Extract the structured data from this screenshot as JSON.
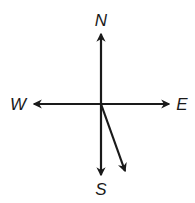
{
  "diagram": {
    "type": "compass-vector",
    "stroke_color": "#1a1a1a",
    "background": "#ffffff",
    "center": {
      "x": 101,
      "y": 104
    },
    "labels": {
      "north": {
        "text": "N",
        "x": 101,
        "y": 20
      },
      "south": {
        "text": "S",
        "x": 101,
        "y": 189
      },
      "east": {
        "text": "E",
        "x": 182,
        "y": 104
      },
      "west": {
        "text": "W",
        "x": 18,
        "y": 104
      }
    },
    "axes": [
      {
        "name": "north",
        "to": {
          "x": 101,
          "y": 34
        }
      },
      {
        "name": "south",
        "to": {
          "x": 101,
          "y": 175
        }
      },
      {
        "name": "east",
        "to": {
          "x": 169,
          "y": 104
        }
      },
      {
        "name": "west",
        "to": {
          "x": 34,
          "y": 104
        }
      }
    ],
    "vector": {
      "name": "south-southeast-vector",
      "from": {
        "x": 101,
        "y": 104
      },
      "to": {
        "x": 125,
        "y": 171
      }
    }
  }
}
